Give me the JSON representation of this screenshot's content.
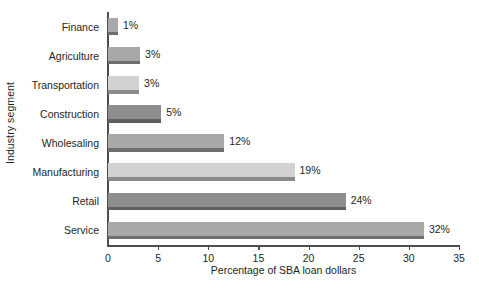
{
  "chart_data": {
    "type": "bar",
    "orientation": "horizontal",
    "title": "",
    "xlabel": "Percentage of SBA loan dollars",
    "ylabel": "Industry segment",
    "xlim": [
      0,
      35
    ],
    "xticks": [
      0,
      5,
      10,
      15,
      20,
      25,
      30,
      35
    ],
    "xtick_labels": [
      "0",
      "5",
      "10",
      "15",
      "20",
      "25",
      "30",
      "35"
    ],
    "grid": false,
    "legend": false,
    "categories": [
      "Finance",
      "Agriculture",
      "Transportation",
      "Construction",
      "Wholesaling",
      "Manufacturing",
      "Retail",
      "Service"
    ],
    "values": [
      1,
      3,
      3,
      5,
      12,
      19,
      24,
      32
    ],
    "bar_lengths": [
      1.0,
      3.2,
      3.1,
      5.3,
      11.6,
      18.6,
      23.7,
      31.5
    ],
    "data_labels": [
      "1%",
      "3%",
      "3%",
      "5%",
      "12%",
      "19%",
      "24%",
      "32%"
    ],
    "bar_tones": [
      "medium",
      "medium",
      "light",
      "dark",
      "medium",
      "light",
      "dark",
      "medium"
    ],
    "colors": {
      "bar_medium": "#a8a8a8",
      "bar_dark": "#8e8e8e",
      "bar_light": "#d2d2d2",
      "shadow_medium": "#6e6e6e",
      "shadow_dark": "#5f5f5f",
      "shadow_light": "#8a8a8a",
      "axis": "#4d4d4f",
      "text": "#231f20",
      "background": "#ffffff"
    }
  }
}
